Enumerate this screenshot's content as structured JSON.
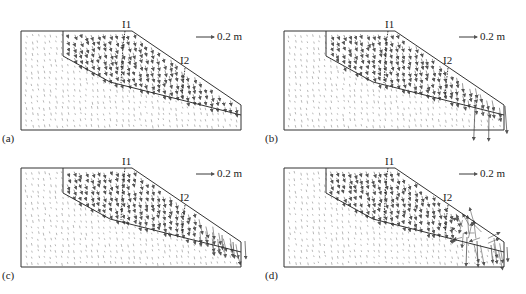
{
  "figure": {
    "panels": [
      {
        "id": "a",
        "label": "(a)",
        "origin": [
          0,
          0
        ],
        "severity": 0,
        "inclinometers": [
          {
            "name": "I1"
          },
          {
            "name": "I2"
          }
        ],
        "scale": {
          "label": "0.2 m"
        }
      },
      {
        "id": "b",
        "label": "(b)",
        "origin": [
          263,
          0
        ],
        "severity": 1,
        "inclinometers": [
          {
            "name": "I1"
          },
          {
            "name": "I2"
          }
        ],
        "scale": {
          "label": "0.2 m"
        }
      },
      {
        "id": "c",
        "label": "(c)",
        "origin": [
          0,
          137
        ],
        "severity": 2,
        "inclinometers": [
          {
            "name": "I1"
          },
          {
            "name": "I2"
          }
        ],
        "scale": {
          "label": "0.2 m"
        }
      },
      {
        "id": "d",
        "label": "(d)",
        "origin": [
          263,
          137
        ],
        "severity": 3,
        "inclinometers": [
          {
            "name": "I1"
          },
          {
            "name": "I2"
          }
        ],
        "scale": {
          "label": "0.2 m"
        }
      }
    ],
    "geometry": {
      "box": {
        "left": 21,
        "top": 31,
        "right": 241,
        "bottom": 130
      },
      "crest": [
        132,
        31
      ],
      "toe": [
        241,
        105
      ],
      "slip_surface": [
        [
          63,
          31
        ],
        [
          63,
          56
        ],
        [
          110,
          82
        ],
        [
          241,
          115
        ]
      ],
      "I1_line": [
        [
          125,
          31
        ],
        [
          123,
          45
        ],
        [
          121,
          83
        ]
      ],
      "I2_line": [
        [
          185,
          68
        ],
        [
          183,
          85
        ],
        [
          182,
          98
        ]
      ],
      "I1_label_pos": [
        122,
        19
      ],
      "I2_label_pos": [
        180,
        55
      ],
      "scale_arrow": {
        "x1": 196,
        "x2": 214,
        "y": 37
      },
      "scale_label_pos": [
        217,
        31
      ],
      "panel_label_pos": [
        19,
        134
      ]
    },
    "colors": {
      "outline": "#333333",
      "arrow": "#555555",
      "dot": "#9a9a9a",
      "text": "#222222"
    }
  }
}
